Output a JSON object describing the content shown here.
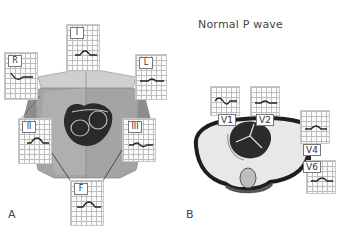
{
  "figure": {
    "title": "Normal P wave",
    "panels": [
      {
        "label": "A",
        "description": "Limb leads around torso with heart",
        "leads": [
          {
            "name": "I",
            "wave": "upright"
          },
          {
            "name": "R",
            "wave": "inverted"
          },
          {
            "name": "L",
            "wave": "low-upright"
          },
          {
            "name": "II",
            "wave": "upright"
          },
          {
            "name": "III",
            "wave": "biphasic-low"
          },
          {
            "name": "F",
            "wave": "upright"
          }
        ]
      },
      {
        "label": "B",
        "description": "Precordial leads around chest cross-section",
        "leads": [
          {
            "name": "V1",
            "wave": "biphasic"
          },
          {
            "name": "V2",
            "wave": "low-upright"
          },
          {
            "name": "V4",
            "wave": "upright"
          },
          {
            "name": "V6",
            "wave": "upright"
          }
        ]
      }
    ]
  },
  "colors": {
    "torso": "#9a9a9a",
    "torso_light": "#c4c4c4",
    "heart": "#2a2a2a",
    "chest_outline": "#222222",
    "lung": "#e6e6e6",
    "grid": "#bdbdbd",
    "trace": "#222222"
  }
}
